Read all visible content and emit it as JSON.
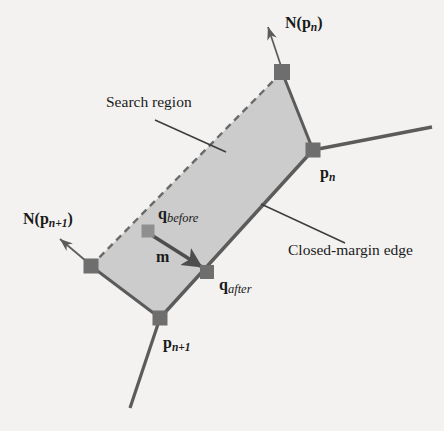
{
  "figure": {
    "name": "closed-margin-search-region-diagram",
    "background_color": "#f3f2f0",
    "region_fill_color": "#c9c9c9",
    "stroke_color": "#5b5b5b",
    "node_color": "#6e6e6e",
    "text_color": "#1a1a1a",
    "labels": {
      "search_region": "Search region",
      "closed_margin_edge": "Closed-margin edge",
      "normal_pn": "N(p",
      "normal_pn_sub": "n",
      "normal_pn_close": ")",
      "normal_pn1": "N(p",
      "normal_pn1_sub": "n+1",
      "normal_pn1_close": ")",
      "point_pn": "p",
      "point_pn_sub": "n",
      "point_pn1": "p",
      "point_pn1_sub": "n+1",
      "q_before": "q",
      "q_before_sub": "before",
      "q_after": "q",
      "q_after_sub": "after",
      "vector_m": "m"
    },
    "geometry": {
      "polygon_points": "282,72 313,150 160,318 91,266",
      "solid_edges": [
        {
          "name": "edge-top-to-pn",
          "x1": 282,
          "y1": 72,
          "x2": 313,
          "y2": 150
        },
        {
          "name": "closed-margin-edge-pn-to-pn1",
          "x1": 313,
          "y1": 150,
          "x2": 160,
          "y2": 318
        },
        {
          "name": "edge-pn1-to-left",
          "x1": 160,
          "y1": 318,
          "x2": 91,
          "y2": 266
        }
      ],
      "dashed_edge": {
        "name": "search-region-open-edge",
        "x1": 91,
        "y1": 266,
        "x2": 282,
        "y2": 72
      },
      "nodes": [
        {
          "name": "node-top",
          "x": 282,
          "y": 72,
          "size": 16,
          "shade": "dark"
        },
        {
          "name": "node-pn",
          "x": 313,
          "y": 150,
          "size": 15,
          "shade": "dark"
        },
        {
          "name": "node-pn1",
          "x": 160,
          "y": 318,
          "size": 15,
          "shade": "dark"
        },
        {
          "name": "node-left",
          "x": 91,
          "y": 266,
          "size": 15,
          "shade": "dark"
        },
        {
          "name": "node-q-before",
          "x": 148,
          "y": 231,
          "size": 13,
          "shade": "light"
        },
        {
          "name": "node-q-after",
          "x": 207,
          "y": 272,
          "size": 14,
          "shade": "dark"
        }
      ],
      "chain_lines": [
        {
          "name": "chain-line-from-pn",
          "x1": 313,
          "y1": 150,
          "x2": 432,
          "y2": 127
        },
        {
          "name": "chain-line-from-pn1",
          "x1": 160,
          "y1": 318,
          "x2": 130,
          "y2": 408
        }
      ],
      "normal_arrows": [
        {
          "name": "normal-arrow-pn",
          "x1": 281,
          "y1": 66,
          "x2": 267,
          "y2": 25
        },
        {
          "name": "normal-arrow-pn1",
          "x1": 86,
          "y1": 261,
          "x2": 59,
          "y2": 238
        }
      ],
      "m_arrow": {
        "name": "m-vector-arrow",
        "x1": 153,
        "y1": 236,
        "x2": 203,
        "y2": 268
      },
      "leader_lines": [
        {
          "name": "leader-search-region",
          "x1": 155,
          "y1": 120,
          "x2": 226,
          "y2": 152
        },
        {
          "name": "leader-closed-margin-edge",
          "x1": 261,
          "y1": 204,
          "x2": 345,
          "y2": 243
        }
      ],
      "label_positions": {
        "search_region": {
          "x": 106,
          "y": 103
        },
        "closed_margin_edge": {
          "x": 288,
          "y": 251
        },
        "normal_pn": {
          "x": 285,
          "y": 24
        },
        "normal_pn1": {
          "x": 23,
          "y": 220
        },
        "point_pn": {
          "x": 320,
          "y": 174
        },
        "point_pn1": {
          "x": 163,
          "y": 344
        },
        "q_before": {
          "x": 158,
          "y": 215
        },
        "q_after": {
          "x": 219,
          "y": 286
        },
        "vector_m": {
          "x": 156,
          "y": 258
        }
      }
    }
  }
}
